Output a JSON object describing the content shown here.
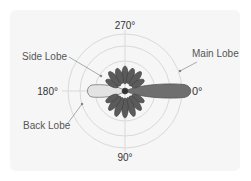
{
  "diagram": {
    "angles": {
      "top": "270°",
      "bottom": "90°",
      "left": "180°",
      "right": "0°"
    },
    "callouts": {
      "main_lobe": "Main Lobe",
      "side_lobe": "Side Lobe",
      "back_lobe": "Back Lobe"
    },
    "rings": 4,
    "colors": {
      "background": "#f6f6f6",
      "grid": "#d8d8d8",
      "main_lobe": "#6e6e6e",
      "side_lobes": "#5a5a5a",
      "back_lobe": "#e0e0e0",
      "text": "#555555"
    }
  }
}
